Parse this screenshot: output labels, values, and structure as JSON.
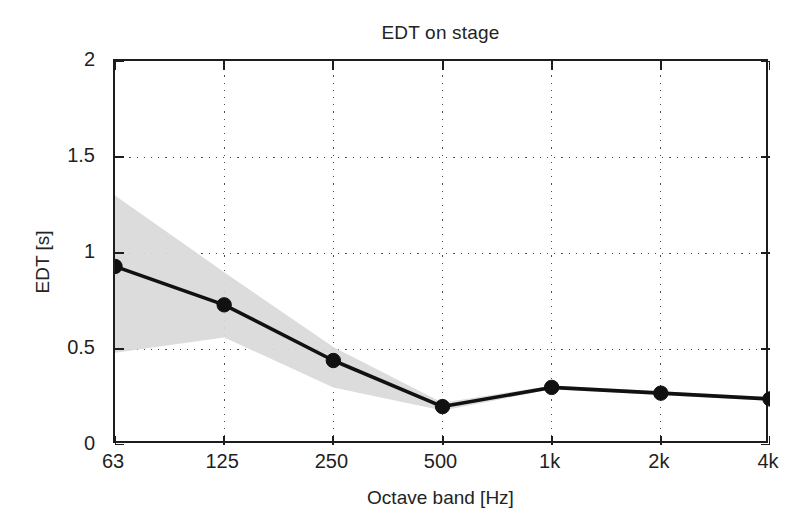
{
  "figure": {
    "background": "#ffffff",
    "frame_color": "#1d1d1d"
  },
  "chart_data": {
    "type": "line",
    "title": "EDT on stage",
    "xlabel": "Octave band [Hz]",
    "ylabel": "EDT [s]",
    "categories": [
      "63",
      "125",
      "250",
      "500",
      "1k",
      "2k",
      "4k"
    ],
    "x_tick_labels": [
      "63",
      "125",
      "250",
      "500",
      "1k",
      "2k",
      "4k"
    ],
    "y_tick_labels": [
      "0",
      "0.5",
      "1",
      "1.5",
      "2"
    ],
    "y_tick_values": [
      0,
      0.5,
      1,
      1.5,
      2
    ],
    "ylim": [
      0,
      2
    ],
    "grid": "dotted",
    "legend": null,
    "series": [
      {
        "name": "EDT mean",
        "marker": "filled-circle",
        "line_color": "#111111",
        "values": [
          0.93,
          0.73,
          0.44,
          0.2,
          0.3,
          0.27,
          0.24
        ]
      }
    ],
    "band": {
      "name": "standard deviation range",
      "fill_color": "#d9d9d9",
      "upper": [
        1.3,
        0.9,
        0.51,
        0.22,
        0.31,
        0.28,
        0.25
      ],
      "lower": [
        0.48,
        0.56,
        0.3,
        0.18,
        0.29,
        0.26,
        0.23
      ]
    }
  }
}
